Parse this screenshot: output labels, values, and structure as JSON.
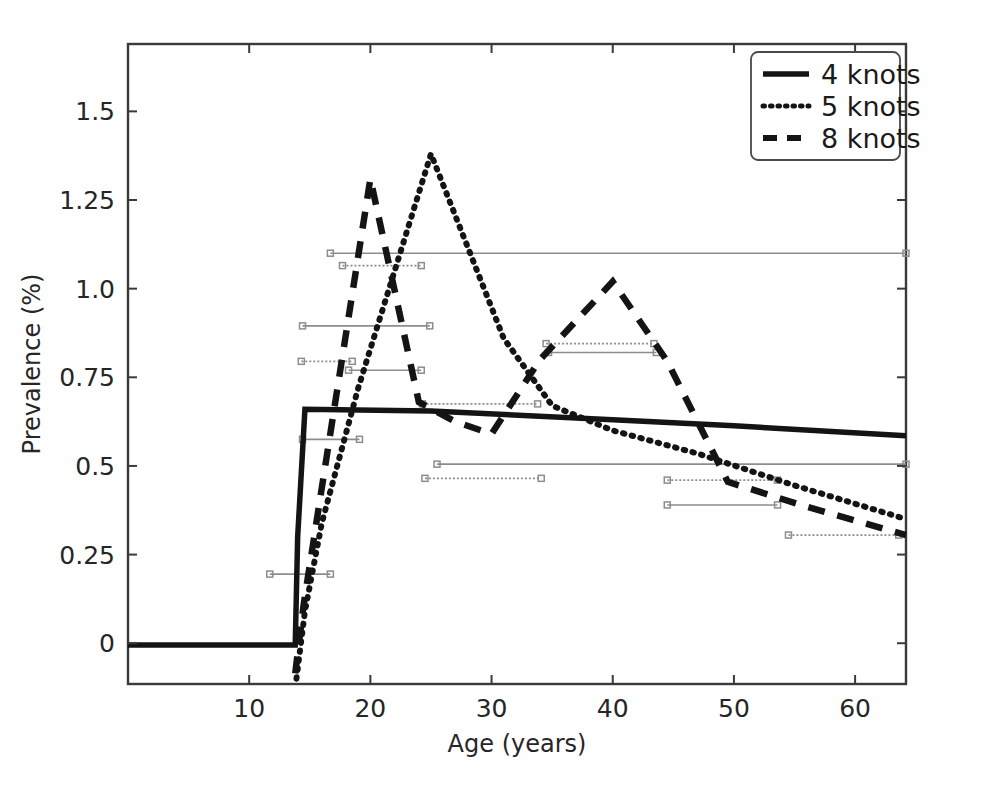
{
  "chart_data": {
    "type": "line",
    "title": "",
    "xlabel": "Age (years)",
    "ylabel": "Prevalence (%)",
    "xlim": [
      0,
      64.2
    ],
    "ylim": [
      -0.115,
      1.69
    ],
    "xticks": [
      10,
      20,
      30,
      40,
      50,
      60
    ],
    "xticklabels": [
      "10",
      "20",
      "30",
      "40",
      "50",
      "60"
    ],
    "yticks": [
      0,
      0.25,
      0.5,
      0.75,
      1.0,
      1.25,
      1.5
    ],
    "yticklabels": [
      "0",
      "0.25",
      "0.5",
      "0.75",
      "1.0",
      "1.25",
      "1.5"
    ],
    "grid": false,
    "legend_position": "upper right",
    "series": [
      {
        "name": "4 knots",
        "style": "solid",
        "x": [
          0.0,
          13.8,
          14.0,
          14.6,
          25.0,
          40.0,
          50.0,
          64.2
        ],
        "y": [
          -0.005,
          -0.005,
          0.3,
          0.66,
          0.655,
          0.63,
          0.613,
          0.585
        ]
      },
      {
        "name": "5 knots",
        "style": "dotted",
        "x": [
          13.9,
          14.6,
          16.0,
          19.0,
          25.0,
          31.0,
          35.0,
          40.0,
          47.0,
          55.0,
          64.2
        ],
        "y": [
          -0.1,
          0.09,
          0.34,
          0.72,
          1.38,
          0.86,
          0.67,
          0.6,
          0.535,
          0.445,
          0.35
        ]
      },
      {
        "name": "8 knots",
        "style": "dashed",
        "x": [
          13.8,
          14.5,
          16.0,
          20.0,
          24.0,
          27.0,
          30.0,
          34.0,
          40.0,
          44.5,
          49.5,
          56.0,
          64.2
        ],
        "y": [
          -0.085,
          0.11,
          0.44,
          1.31,
          0.68,
          0.625,
          0.59,
          0.8,
          1.02,
          0.795,
          0.455,
          0.385,
          0.305
        ]
      }
    ],
    "error_bars": [
      {
        "y": 1.1,
        "x0": 16.7,
        "x1": 64.2,
        "style": "solid"
      },
      {
        "y": 1.065,
        "x0": 17.7,
        "x1": 24.2,
        "style": "dotted"
      },
      {
        "y": 0.895,
        "x0": 14.4,
        "x1": 24.9,
        "style": "solid"
      },
      {
        "y": 0.795,
        "x0": 14.3,
        "x1": 18.5,
        "style": "dotted"
      },
      {
        "y": 0.77,
        "x0": 18.2,
        "x1": 24.2,
        "style": "solid"
      },
      {
        "y": 0.845,
        "x0": 34.5,
        "x1": 43.4,
        "style": "dotted"
      },
      {
        "y": 0.82,
        "x0": 34.7,
        "x1": 43.6,
        "style": "solid"
      },
      {
        "y": 0.675,
        "x0": 24.3,
        "x1": 33.8,
        "style": "dotted"
      },
      {
        "y": 0.575,
        "x0": 14.4,
        "x1": 19.1,
        "style": "solid"
      },
      {
        "y": 0.505,
        "x0": 25.5,
        "x1": 64.2,
        "style": "solid"
      },
      {
        "y": 0.465,
        "x0": 24.5,
        "x1": 34.1,
        "style": "dotted"
      },
      {
        "y": 0.46,
        "x0": 44.5,
        "x1": 53.6,
        "style": "dotted"
      },
      {
        "y": 0.39,
        "x0": 44.5,
        "x1": 53.6,
        "style": "solid"
      },
      {
        "y": 0.305,
        "x0": 54.5,
        "x1": 63.6,
        "style": "dotted"
      },
      {
        "y": 0.195,
        "x0": 11.7,
        "x1": 16.7,
        "style": "solid"
      }
    ]
  },
  "legend": {
    "entries": [
      {
        "label": "4 knots",
        "style": "solid"
      },
      {
        "label": "5 knots",
        "style": "dotted"
      },
      {
        "label": "8 knots",
        "style": "dashed"
      }
    ]
  }
}
